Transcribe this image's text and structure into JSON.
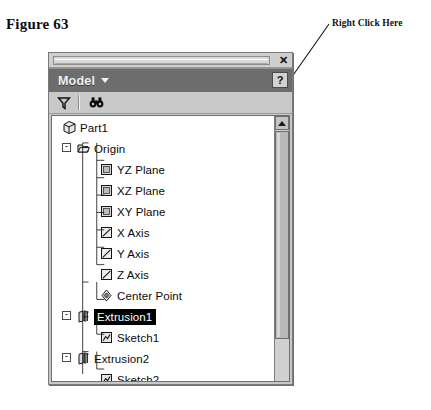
{
  "figure": {
    "caption": "Figure 63",
    "annotation": "Right Click Here"
  },
  "panel": {
    "close_label": "✕",
    "header": {
      "title": "Model",
      "dropdown_caret": "caret-down-icon",
      "help_label": "?"
    },
    "toolbar": {
      "buttons": [
        {
          "name": "filter-icon",
          "label": "Filter"
        },
        {
          "name": "find-icon",
          "label": "Find"
        }
      ]
    },
    "scrollbar": {
      "up_arrow": "scroll-up-icon",
      "thumb": "scroll-thumb"
    }
  },
  "tree": {
    "items": [
      {
        "label": "Part1",
        "depth": 0,
        "icon": "part-cube-icon",
        "expander": "",
        "selected": false,
        "cut": false
      },
      {
        "label": "Origin",
        "depth": 1,
        "icon": "origin-folder-icon",
        "expander": "-",
        "selected": false,
        "cut": false
      },
      {
        "label": "YZ Plane",
        "depth": 2,
        "icon": "plane-icon",
        "expander": "",
        "selected": false,
        "cut": false
      },
      {
        "label": "XZ Plane",
        "depth": 2,
        "icon": "plane-icon",
        "expander": "",
        "selected": false,
        "cut": false
      },
      {
        "label": "XY Plane",
        "depth": 2,
        "icon": "plane-icon",
        "expander": "",
        "selected": false,
        "cut": false
      },
      {
        "label": "X Axis",
        "depth": 2,
        "icon": "axis-icon",
        "expander": "",
        "selected": false,
        "cut": false
      },
      {
        "label": "Y Axis",
        "depth": 2,
        "icon": "axis-icon",
        "expander": "",
        "selected": false,
        "cut": false
      },
      {
        "label": "Z Axis",
        "depth": 2,
        "icon": "axis-icon",
        "expander": "",
        "selected": false,
        "cut": false
      },
      {
        "label": "Center Point",
        "depth": 2,
        "icon": "center-point-icon",
        "expander": "",
        "selected": false,
        "cut": false
      },
      {
        "label": "Extrusion1",
        "depth": 1,
        "icon": "extrusion-icon",
        "expander": "-",
        "selected": true,
        "cut": false
      },
      {
        "label": "Sketch1",
        "depth": 2,
        "icon": "sketch-icon",
        "expander": "",
        "selected": false,
        "cut": false
      },
      {
        "label": "Extrusion2",
        "depth": 1,
        "icon": "extrusion-icon",
        "expander": "-",
        "selected": false,
        "cut": false
      },
      {
        "label": "Sketch2",
        "depth": 2,
        "icon": "sketch-icon",
        "expander": "",
        "selected": false,
        "cut": false
      },
      {
        "label": "Circular Pattern1",
        "depth": 1,
        "icon": "circular-pattern-icon",
        "expander": "-",
        "selected": false,
        "cut": false
      },
      {
        "label": "Fastener",
        "depth": 2,
        "icon": "fastener-icon",
        "expander": "",
        "selected": false,
        "cut": true
      }
    ]
  },
  "colors": {
    "panel_bg": "#c8c8c8",
    "header_bg": "#6d6d6d",
    "header_text": "#f2f2f2",
    "tree_bg": "#ffffff",
    "selection_bg": "#000000",
    "selection_text": "#ffffff"
  }
}
